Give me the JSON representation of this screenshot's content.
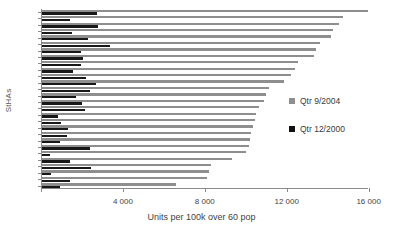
{
  "chart_data": {
    "type": "bar",
    "orientation": "horizontal",
    "title": "",
    "xlabel": "Units per 100k over 60 pop",
    "ylabel": "StHAs",
    "xlim": [
      0,
      16800
    ],
    "xticks": [
      0,
      4000,
      8000,
      12000,
      16000
    ],
    "xticklabels": [
      "",
      "4 000",
      "8 000",
      "12 000",
      "16 000"
    ],
    "grid": false,
    "legend_position": "right-middle",
    "categories": [
      "StHA 1",
      "StHA 2",
      "StHA 3",
      "StHA 4",
      "StHA 5",
      "StHA 6",
      "StHA 7",
      "StHA 8",
      "StHA 9",
      "StHA 10",
      "StHA 11",
      "StHA 12",
      "StHA 13",
      "StHA 14",
      "StHA 15",
      "StHA 16",
      "StHA 17",
      "StHA 18",
      "StHA 19",
      "StHA 20",
      "StHA 21",
      "StHA 22",
      "StHA 23",
      "StHA 24",
      "StHA 25",
      "StHA 26",
      "StHA 27",
      "StHA 28"
    ],
    "series": [
      {
        "name": "Qtr 9/2004",
        "color": "#8e8e8e",
        "values": [
          15900,
          14700,
          14500,
          14200,
          14100,
          13600,
          13400,
          13300,
          12500,
          12350,
          12150,
          11800,
          11100,
          10950,
          10850,
          10600,
          10450,
          10400,
          10300,
          10200,
          10150,
          10100,
          9950,
          9300,
          8250,
          8150,
          8050,
          6550
        ]
      },
      {
        "name": "Qtr 12/2000",
        "color": "#181818",
        "values": [
          2700,
          1350,
          2750,
          1450,
          2250,
          3300,
          1900,
          2000,
          1900,
          1500,
          2150,
          2650,
          2350,
          1650,
          1950,
          2100,
          800,
          950,
          1250,
          1200,
          900,
          2350,
          400,
          1350,
          2400,
          450,
          1350,
          900
        ]
      }
    ]
  },
  "legend": {
    "items": [
      {
        "label": "Qtr 9/2004",
        "color": "#8e8e8e"
      },
      {
        "label": "Qtr 12/2000",
        "color": "#111111"
      }
    ]
  }
}
